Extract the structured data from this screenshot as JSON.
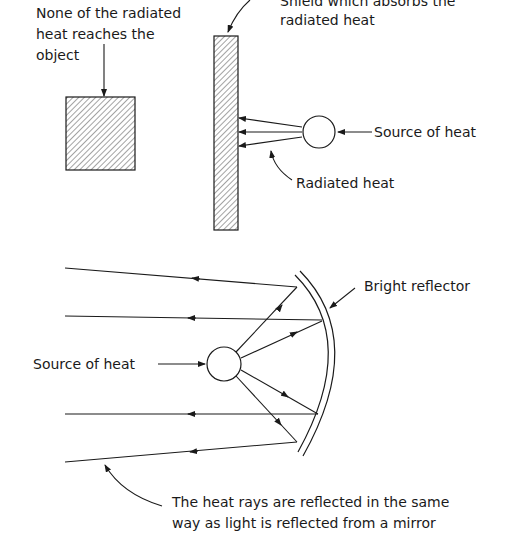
{
  "top_diagram": {
    "labels": {
      "object_note_line1": "None of the radiated",
      "object_note_line2": "heat reaches the",
      "object_note_line3": "object",
      "shield_line1": "Shield which absorbs the",
      "shield_line2": "radiated heat",
      "source": "Source of heat",
      "radiated": "Radiated heat"
    }
  },
  "bottom_diagram": {
    "labels": {
      "reflector": "Bright reflector",
      "source": "Source of heat",
      "caption_line1": "The heat rays are reflected in the same",
      "caption_line2": "way as light is reflected from a mirror"
    }
  },
  "colors": {
    "ink": "#1a1a1a",
    "background": "#ffffff"
  }
}
